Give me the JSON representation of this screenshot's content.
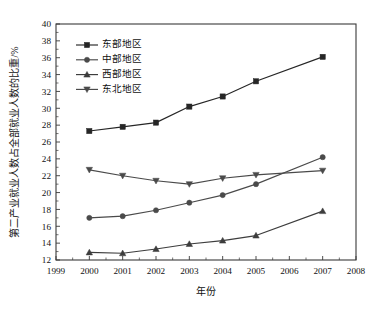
{
  "chart_data": {
    "type": "line",
    "title": "",
    "xlabel": "年份",
    "ylabel": "第二产业就业人数占全部就业人数的比重/%",
    "x": [
      2000,
      2001,
      2002,
      2003,
      2004,
      2005,
      2007
    ],
    "xlim": [
      1999,
      2008
    ],
    "ylim": [
      12,
      40
    ],
    "xticks": [
      "1999",
      "2000",
      "2001",
      "2002",
      "2003",
      "2004",
      "2005",
      "2006",
      "2007",
      "2008"
    ],
    "yticks": [
      "12",
      "14",
      "16",
      "18",
      "20",
      "22",
      "24",
      "26",
      "28",
      "30",
      "32",
      "34",
      "36",
      "38",
      "40"
    ],
    "grid": false,
    "legend_position": "top-left",
    "series": [
      {
        "name": "东部地区",
        "marker": "square",
        "color": "#262626",
        "values": [
          27.3,
          27.8,
          28.3,
          30.2,
          31.4,
          33.2,
          36.1
        ]
      },
      {
        "name": "中部地区",
        "marker": "circle",
        "color": "#4a4a4a",
        "values": [
          17.0,
          17.2,
          17.9,
          18.8,
          19.7,
          21.0,
          24.2
        ]
      },
      {
        "name": "西部地区",
        "marker": "triangle-up",
        "color": "#3d3d3d",
        "values": [
          12.9,
          12.8,
          13.3,
          13.9,
          14.3,
          14.9,
          17.8
        ]
      },
      {
        "name": "东北地区",
        "marker": "triangle-down",
        "color": "#4a4a4a",
        "values": [
          22.7,
          22.0,
          21.4,
          21.0,
          21.7,
          22.1,
          22.6
        ]
      }
    ]
  },
  "legend": {
    "entries": [
      "东部地区",
      "中部地区",
      "西部地区",
      "东北地区"
    ]
  }
}
